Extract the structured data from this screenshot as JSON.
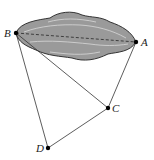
{
  "diagram": {
    "points": {
      "A": {
        "label": "A",
        "x": 136,
        "y": 42
      },
      "B": {
        "label": "B",
        "x": 16,
        "y": 33
      },
      "C": {
        "label": "C",
        "x": 108,
        "y": 108
      },
      "D": {
        "label": "D",
        "x": 48,
        "y": 148
      }
    },
    "segments": [
      {
        "from": "B",
        "to": "A",
        "style": "dashed"
      },
      {
        "from": "B",
        "to": "C",
        "style": "solid"
      },
      {
        "from": "A",
        "to": "C",
        "style": "solid"
      },
      {
        "from": "B",
        "to": "D",
        "style": "solid"
      },
      {
        "from": "D",
        "to": "C",
        "style": "solid"
      }
    ],
    "region": {
      "name": "lake",
      "fill": "#9a9a9a",
      "stroke": "#333333"
    }
  }
}
